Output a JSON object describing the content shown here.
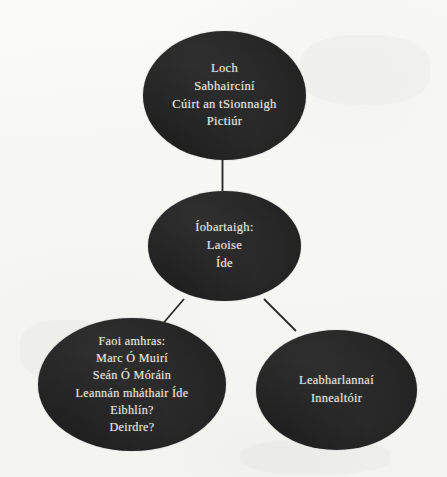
{
  "diagram": {
    "type": "node-link",
    "language": "Irish",
    "background_color": "#f7f7f5",
    "node_fill_color": "#262626",
    "node_text_color": "#e4e3de",
    "link_color": "#2a2a2a",
    "nodes": [
      {
        "id": "top",
        "name": "places-node",
        "lines": [
          "Loch",
          "Sabhaircíní",
          "Cúirt an tSionnaigh",
          "Pictiúr"
        ]
      },
      {
        "id": "middle",
        "name": "victims-node",
        "lines": [
          "Íobartaigh:",
          "Laoise",
          "Íde"
        ]
      },
      {
        "id": "suspects",
        "name": "suspects-node",
        "lines": [
          "Faoi amhras:",
          "Marc Ó Muirí",
          "Seán Ó Móráin",
          "Leannán mháthair Íde",
          "Eibhlín?",
          "Deirdre?"
        ]
      },
      {
        "id": "occupations",
        "name": "occupations-node",
        "lines": [
          "Leabharlannaí",
          "Innealtóir"
        ]
      }
    ],
    "links": [
      {
        "from": "top",
        "to": "middle",
        "name": "link-top-middle"
      },
      {
        "from": "middle",
        "to": "suspects",
        "name": "link-middle-suspects"
      },
      {
        "from": "middle",
        "to": "occupations",
        "name": "link-middle-occupations"
      }
    ]
  }
}
